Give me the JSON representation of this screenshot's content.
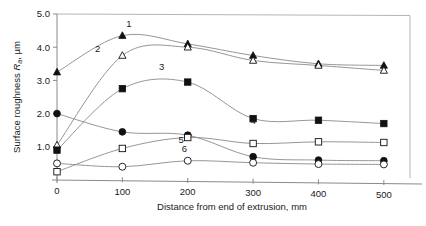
{
  "chart_data": {
    "type": "line",
    "title": "",
    "xlabel": "Distance from end of extrusion, mm",
    "ylabel_main": "Surface roughness ",
    "ylabel_symbol": "R",
    "ylabel_subscript": "a",
    "ylabel_units": ", µm",
    "xlim": [
      0,
      540
    ],
    "ylim": [
      0,
      5.0
    ],
    "xticks": [
      0,
      100,
      200,
      300,
      400,
      500
    ],
    "xticklabels": [
      "0",
      "100",
      "200",
      "300",
      "400",
      "500"
    ],
    "yticks": [
      1.0,
      2.0,
      3.0,
      4.0,
      5.0
    ],
    "yticklabels": [
      "1.0",
      "2.0",
      "3.0",
      "4.0",
      "5.0"
    ],
    "grid": false,
    "legend": "inline-curve-numbers",
    "x": [
      0,
      100,
      200,
      300,
      400,
      500
    ],
    "series": [
      {
        "name": "1",
        "label": "1",
        "marker": "filled-triangle",
        "values": [
          3.25,
          4.35,
          4.1,
          3.75,
          3.5,
          3.45
        ],
        "label_x": 110,
        "label_y": 4.6
      },
      {
        "name": "2",
        "label": "2",
        "marker": "open-triangle",
        "values": [
          1.05,
          3.75,
          4.0,
          3.6,
          3.45,
          3.3
        ],
        "label_x": 62,
        "label_y": 3.85
      },
      {
        "name": "3",
        "label": "3",
        "marker": "filled-square",
        "values": [
          0.9,
          2.75,
          2.95,
          1.85,
          1.8,
          1.7
        ],
        "label_x": 160,
        "label_y": 3.3
      },
      {
        "name": "4",
        "label": "4",
        "marker": "filled-circle",
        "values": [
          2.0,
          1.45,
          1.35,
          0.7,
          0.6,
          0.58
        ],
        "label_x": 300,
        "label_y": 1.68
      },
      {
        "name": "5",
        "label": "5",
        "marker": "open-square",
        "values": [
          0.25,
          0.95,
          1.28,
          1.1,
          1.15,
          1.13
        ],
        "label_x": 190,
        "label_y": 1.1
      },
      {
        "name": "6",
        "label": "6",
        "marker": "open-circle",
        "values": [
          0.5,
          0.4,
          0.58,
          0.52,
          0.48,
          0.47
        ],
        "label_x": 195,
        "label_y": 0.83
      }
    ]
  }
}
